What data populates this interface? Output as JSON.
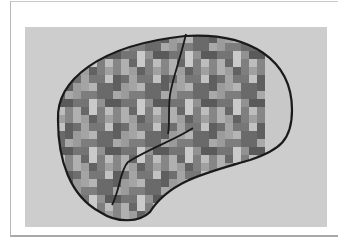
{
  "figure": {
    "colors": {
      "background": "#cdcdcd",
      "outline": "#1a1a1a",
      "frame": "#b0b0b0"
    }
  }
}
